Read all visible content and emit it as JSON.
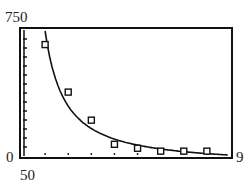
{
  "chart_data": {
    "type": "scatter",
    "title": "",
    "xlabel": "",
    "ylabel": "",
    "xlim": [
      0,
      9
    ],
    "ylim": [
      50,
      750
    ],
    "window_labels": {
      "ymax": "750",
      "xmin": "0",
      "xmax": "9",
      "ymin": "50"
    },
    "points": [
      {
        "x": 1,
        "y": 669
      },
      {
        "x": 2,
        "y": 405
      },
      {
        "x": 3,
        "y": 249
      },
      {
        "x": 4,
        "y": 115
      },
      {
        "x": 5,
        "y": 93
      },
      {
        "x": 6,
        "y": 77
      },
      {
        "x": 7,
        "y": 77
      },
      {
        "x": 8,
        "y": 77
      }
    ],
    "fit_curve": {
      "type": "power",
      "description": "decreasing curve fit to data"
    },
    "x_ticks": [
      1,
      2,
      3,
      4,
      5,
      6,
      7,
      8
    ],
    "grid": false
  }
}
